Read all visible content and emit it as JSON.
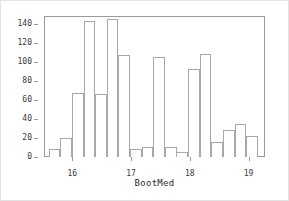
{
  "chart_data": {
    "type": "bar",
    "title": "",
    "subtitle": "",
    "xlabel": "BootMed",
    "ylabel": "",
    "grid": false,
    "legend": null,
    "xlim": [
      15.52,
      19.28
    ],
    "ylim": [
      0,
      148
    ],
    "xticks": [
      16,
      17,
      18,
      19
    ],
    "xtick_labels": [
      "16",
      "17",
      "18",
      "19"
    ],
    "yticks": [
      0,
      20,
      40,
      60,
      80,
      100,
      120,
      140
    ],
    "ytick_labels": [
      "0",
      "20",
      "40",
      "60",
      "80",
      "100",
      "120",
      "140"
    ],
    "bin_width": 0.1976,
    "bin_starts": [
      15.6,
      15.798,
      15.995,
      16.193,
      16.391,
      16.588,
      16.786,
      16.984,
      17.181,
      17.379,
      17.577,
      17.774,
      17.972,
      18.17,
      18.367,
      18.565,
      18.763,
      18.96,
      19.158
    ],
    "categories": [
      "15.60-15.80",
      "15.80-16.00",
      "16.00-16.19",
      "16.19-16.39",
      "16.39-16.59",
      "16.59-16.79",
      "16.79-16.98",
      "16.98-17.18",
      "17.18-17.38",
      "17.38-17.58",
      "17.58-17.77",
      "17.77-17.97",
      "17.97-18.17",
      "18.17-18.37",
      "18.37-18.56",
      "18.56-18.76",
      "18.76-18.96",
      "18.96-19.16",
      "19.16-19.36"
    ],
    "values": [
      8,
      20,
      67,
      143,
      66,
      145,
      107,
      8,
      11,
      105,
      10,
      5,
      92,
      108,
      16,
      28,
      35,
      22,
      0
    ]
  },
  "chart_meta": {
    "axis_color": "#9a9a9a",
    "bar_edge_color": "#a8a8a8",
    "bar_fill_color": "#ffffff",
    "text_color": "#3a3a3a",
    "background_color": "#ffffff"
  }
}
